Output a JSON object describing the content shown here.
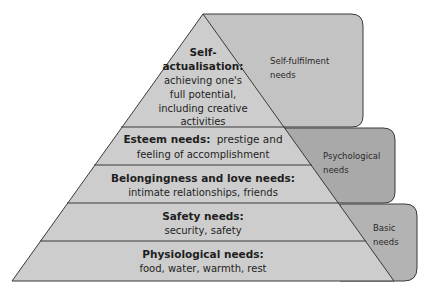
{
  "colors": {
    "background": "#ffffff",
    "pyramid_fill": "#cdcdcd",
    "line": "#3a3a3a",
    "self_fulfilment_box": "#c3c3c3",
    "psychological_box": "#a9a9a9",
    "basic_box": "#b3b3b3"
  },
  "pyramid": {
    "tiers": [
      {
        "id": "self-actualisation",
        "title_line1": "Self-",
        "title_line2": "actualisation:",
        "desc_line1": "achieving one's",
        "desc_line2": "full potential,",
        "desc_line3": "including creative",
        "desc_line4": "activities"
      },
      {
        "id": "esteem",
        "title": "Esteem needs:",
        "desc_inline": "prestige and",
        "desc_line2": "feeling of accomplishment"
      },
      {
        "id": "belongingness",
        "title": "Belongingness and love needs:",
        "desc": "intimate relationships, friends"
      },
      {
        "id": "safety",
        "title": "Safety needs:",
        "desc": "security, safety"
      },
      {
        "id": "physiological",
        "title": "Physiological needs:",
        "desc": "food, water, warmth, rest"
      }
    ]
  },
  "categories": [
    {
      "id": "self-fulfilment",
      "line1": "Self-fulfilment",
      "line2": "needs"
    },
    {
      "id": "psychological",
      "line1": "Psychological",
      "line2": "needs"
    },
    {
      "id": "basic",
      "line1": "Basic",
      "line2": "needs"
    }
  ]
}
